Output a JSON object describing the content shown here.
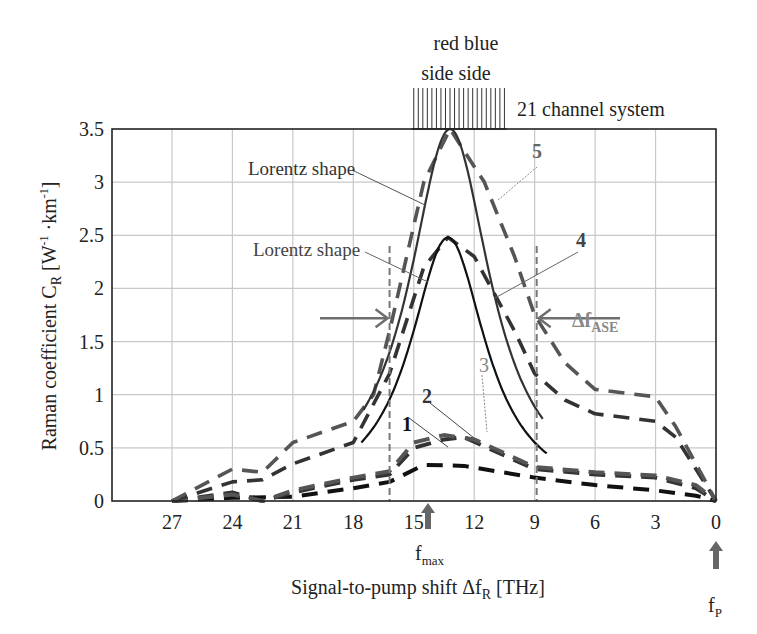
{
  "chart_data": {
    "type": "line",
    "title": "",
    "xlabel": "Signal-to-pump shift Δf_R [THz]",
    "xlabel_main": "Signal-to-pump shift Δf",
    "xlabel_sub": "R",
    "xlabel_unit": " [THz]",
    "ylabel_main": "Raman coefficient C",
    "ylabel_sub": "R",
    "ylabel_unit_a": " [W",
    "ylabel_sup1": "-1",
    "ylabel_unit_b": " ·km",
    "ylabel_sup2": "-1",
    "ylabel_unit_c": "]",
    "ylabel": "Raman coefficient C_R [W^-1 ·km^-1]",
    "xlim": [
      30,
      0
    ],
    "ylim": [
      0,
      3.5
    ],
    "x_reversed": true,
    "grid": true,
    "xticks": [
      27,
      24,
      21,
      18,
      15,
      12,
      9,
      6,
      3,
      0
    ],
    "yticks": [
      0,
      0.5,
      1,
      1.5,
      2,
      2.5,
      3,
      3.5
    ],
    "ytick_labels": [
      "0",
      "0.5",
      "1",
      "1.5",
      "2",
      "2.5",
      "3",
      "3.5"
    ],
    "series": [
      {
        "name": "1",
        "style": "dashed",
        "color": "#111111",
        "x": [
          27,
          24,
          21,
          18,
          16.2,
          14.5,
          12.5,
          9,
          6,
          3,
          1,
          0
        ],
        "y": [
          0.0,
          0.03,
          0.04,
          0.12,
          0.18,
          0.34,
          0.33,
          0.22,
          0.15,
          0.1,
          0.05,
          0.0
        ]
      },
      {
        "name": "2",
        "style": "dashed",
        "color": "#333333",
        "x": [
          27,
          24,
          22.5,
          21,
          18,
          16.2,
          15,
          13.5,
          12.5,
          9,
          6,
          3,
          1,
          0
        ],
        "y": [
          0.0,
          0.08,
          0.0,
          0.08,
          0.2,
          0.25,
          0.5,
          0.58,
          0.6,
          0.3,
          0.25,
          0.22,
          0.12,
          0.0
        ]
      },
      {
        "name": "3",
        "style": "dashed",
        "color": "#555555",
        "x": [
          27,
          24,
          22.5,
          21,
          18,
          16.2,
          15,
          13.5,
          12,
          9,
          6,
          3,
          1,
          0
        ],
        "y": [
          0.0,
          0.06,
          0.0,
          0.1,
          0.22,
          0.28,
          0.55,
          0.62,
          0.58,
          0.32,
          0.27,
          0.24,
          0.15,
          0.0
        ]
      },
      {
        "name": "4",
        "style": "dashed",
        "color": "#333333",
        "x": [
          27,
          24,
          22.5,
          21,
          18,
          16.2,
          14.5,
          13.3,
          12,
          10,
          9,
          7.5,
          6,
          3,
          2,
          1,
          0
        ],
        "y": [
          0.0,
          0.18,
          0.2,
          0.35,
          0.55,
          1.2,
          2.2,
          2.48,
          2.3,
          1.6,
          1.2,
          0.95,
          0.82,
          0.75,
          0.6,
          0.3,
          0.0
        ]
      },
      {
        "name": "5",
        "style": "dashed",
        "color": "#555555",
        "x": [
          27,
          24,
          22.5,
          21,
          18,
          17,
          16.2,
          14.5,
          13.2,
          11.5,
          10,
          9,
          7.5,
          6,
          3,
          2,
          1,
          0
        ],
        "y": [
          0.0,
          0.3,
          0.27,
          0.55,
          0.75,
          1.0,
          1.6,
          3.0,
          3.5,
          3.0,
          2.3,
          1.75,
          1.3,
          1.05,
          0.98,
          0.7,
          0.35,
          0.0
        ]
      },
      {
        "name": "Lorentz shape (upper)",
        "style": "solid",
        "color": "#333333",
        "lorentz": {
          "x0": 13.2,
          "peak": 3.5,
          "hwhm": 2.45,
          "x_from": 17.5,
          "x_to": 8.6
        }
      },
      {
        "name": "Lorentz shape (lower)",
        "style": "solid",
        "color": "#111111",
        "lorentz": {
          "x0": 13.3,
          "peak": 2.48,
          "hwhm": 2.3,
          "x_from": 17.6,
          "x_to": 8.4
        }
      }
    ],
    "annotations": [
      {
        "text": "red blue",
        "role": "channel-sides-top"
      },
      {
        "text": "side side",
        "role": "channel-sides-bottom"
      },
      {
        "text": "21 channel system",
        "role": "channel-comb-label"
      },
      {
        "text": "Lorentz shape",
        "role": "upper-lorentz-label"
      },
      {
        "text": "Lorentz shape",
        "role": "lower-lorentz-label"
      },
      {
        "text": "Δf",
        "sub": "ASE",
        "role": "ase-bandwidth-label"
      },
      {
        "text": "f",
        "sub": "max",
        "role": "fmax-marker",
        "x": 13.5
      },
      {
        "text": "f",
        "sub": "P",
        "role": "pump-marker",
        "x": 0
      },
      {
        "text": "1",
        "role": "curve-label"
      },
      {
        "text": "2",
        "role": "curve-label"
      },
      {
        "text": "3",
        "role": "curve-label"
      },
      {
        "text": "4",
        "role": "curve-label"
      },
      {
        "text": "5",
        "role": "curve-label"
      }
    ],
    "channel_comb": {
      "count": 21,
      "x_from": 15,
      "x_to": 10.5
    },
    "ase_band": {
      "x_left": 16.2,
      "x_right": 8.9,
      "arrow_y": 1.72
    }
  },
  "labels": {
    "red_blue": "red blue",
    "side_side": "side side",
    "channel_system": "21 channel system",
    "lorentz_upper": "Lorentz shape",
    "lorentz_lower": "Lorentz shape",
    "delta_f": "Δf",
    "ase_sub": "ASE",
    "f": "f",
    "max_sub": "max",
    "p_sub": "P",
    "c1": "1",
    "c2": "2",
    "c3": "3",
    "c4": "4",
    "c5": "5"
  },
  "colors": {
    "grid": "#c8c8c8",
    "axis": "#222222",
    "annot_gray": "#777777",
    "arrow_gray": "#6e6e6e"
  }
}
